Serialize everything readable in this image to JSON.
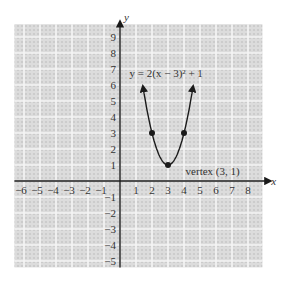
{
  "chart_data": {
    "type": "line",
    "title": "",
    "equation_label": "y =  2(x − 3)² + 1",
    "xlabel": "x",
    "ylabel": "y",
    "xlim": [
      -6,
      8
    ],
    "ylim": [
      -5,
      9
    ],
    "grid": true,
    "x_ticks": [
      -6,
      -5,
      -4,
      -3,
      -2,
      -1,
      1,
      2,
      3,
      4,
      5,
      6,
      7,
      8
    ],
    "y_ticks": [
      9,
      8,
      7,
      6,
      5,
      4,
      3,
      2,
      1,
      -1,
      -2,
      -3,
      -4,
      -5
    ],
    "x_tick_labels": [
      "−6",
      "−5",
      "−4",
      "−3",
      "−2",
      "−1",
      "1",
      "2",
      "3",
      "4",
      "5",
      "6",
      "7",
      "8"
    ],
    "y_tick_labels": [
      "9",
      "8",
      "7",
      "6",
      "5",
      "4",
      "3",
      "2",
      "1",
      "−1",
      "−2",
      "−3",
      "−4",
      "−5"
    ],
    "series": [
      {
        "name": "y = 2(x - 3)^2 + 1",
        "function": {
          "a": 2,
          "h": 3,
          "k": 1
        },
        "x_range": [
          1.45,
          4.55
        ],
        "points": [
          {
            "x": 2,
            "y": 3
          },
          {
            "x": 3,
            "y": 1
          },
          {
            "x": 4,
            "y": 3
          }
        ]
      }
    ],
    "annotations": [
      {
        "text": "vertex (3, 1)",
        "x": 3,
        "y": 1
      }
    ]
  },
  "colors": {
    "axis": "#1a1a1a",
    "curve": "#1a1a1a",
    "grid_bg": "#d9d9d9",
    "grid_line": "#f4f4f4"
  }
}
